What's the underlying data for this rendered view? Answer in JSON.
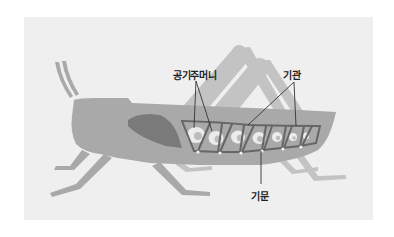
{
  "figure": {
    "labels": {
      "air_sacs": "공기주머니",
      "trachea": "기관",
      "spiracle": "기문"
    }
  },
  "colors": {
    "page_background": "#ffffff",
    "panel_background": "#efefef",
    "body_main": "#a9a9a9",
    "body_back_legs": "#c3c3c3",
    "dark_organ": "#7a7a7a",
    "trachea_tube": "#666666",
    "air_sac_glow": "#f4f4f4",
    "leader_line": "#333333",
    "spiracle_dot": "#f2f2f2"
  }
}
